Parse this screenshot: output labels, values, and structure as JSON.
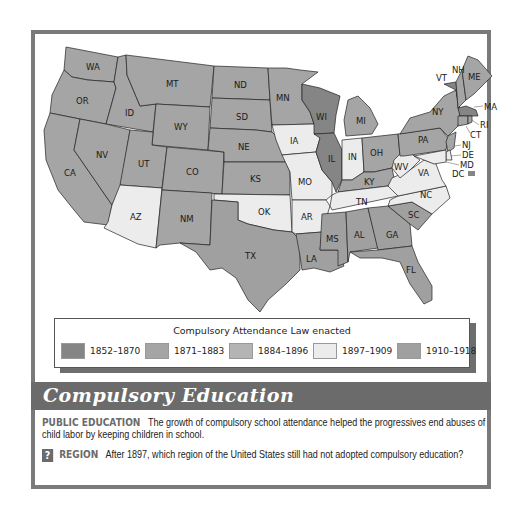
{
  "colors": {
    "1852-1870": "#858585",
    "1871-1883": "#a5a5a5",
    "1884-1896": "#b4b4b4",
    "1897-1909": "#ececec",
    "1910-1918": "#a0a0a0",
    "banner": "#6b6b6b",
    "frame": "#7a7a7a"
  },
  "legend": {
    "title": "Compulsory Attendance Law enacted",
    "items": [
      {
        "label": "1852–1870",
        "period": "1852-1870"
      },
      {
        "label": "1871–1883",
        "period": "1871-1883"
      },
      {
        "label": "1884–1896",
        "period": "1884-1896"
      },
      {
        "label": "1897–1909",
        "period": "1897-1909"
      },
      {
        "label": "1910–1918",
        "period": "1910-1918"
      }
    ]
  },
  "map": {
    "states": {
      "WA": "WA",
      "OR": "OR",
      "CA": "CA",
      "ID": "ID",
      "NV": "NV",
      "MT": "MT",
      "WY": "WY",
      "UT": "UT",
      "AZ": "AZ",
      "CO": "CO",
      "NM": "NM",
      "ND": "ND",
      "SD": "SD",
      "NE": "NE",
      "KS": "KS",
      "OK": "OK",
      "TX": "TX",
      "MN": "MN",
      "IA": "IA",
      "MO": "MO",
      "AR": "AR",
      "LA": "LA",
      "WI": "WI",
      "IL": "IL",
      "MI": "MI",
      "IN": "IN",
      "OH": "OH",
      "KY": "KY",
      "TN": "TN",
      "MS": "MS",
      "AL": "AL",
      "GA": "GA",
      "FL": "FL",
      "SC": "SC",
      "NC": "NC",
      "VA": "VA",
      "WV": "WV",
      "PA": "PA",
      "NY": "NY",
      "VT": "VT",
      "NH": "NH",
      "ME": "ME",
      "MA": "MA",
      "RI": "RI",
      "CT": "CT",
      "NJ": "NJ",
      "DE": "DE",
      "MD": "MD",
      "DC": "DC"
    }
  },
  "title": "Compulsory Education",
  "caption": {
    "public_education_kw": "PUBLIC EDUCATION",
    "public_education_text": "The growth of compulsory school attendance helped the progressives end abuses of child labor by keeping children in school.",
    "question_icon": "?",
    "region_kw": "REGION",
    "region_text": "After 1897, which region of the United States still had not adopted compulsory education?"
  }
}
